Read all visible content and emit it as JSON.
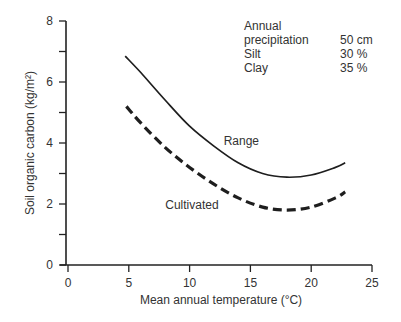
{
  "chart_data": {
    "type": "line",
    "title": "",
    "xlabel": "Mean annual temperature (°C)",
    "ylabel": "Soil organic carbon (kg/m²)",
    "xlim": [
      0,
      25
    ],
    "ylim": [
      0,
      8
    ],
    "x_ticks": [
      0,
      5,
      10,
      15,
      20,
      25
    ],
    "x_tick_labels": [
      "0",
      "5",
      "10",
      "15",
      "20",
      "25"
    ],
    "y_ticks_major": [
      0,
      2,
      4,
      6,
      8
    ],
    "y_tick_labels": [
      "0",
      "2",
      "4",
      "6",
      "8"
    ],
    "y_ticks_minor": [
      1,
      3,
      5,
      7
    ],
    "grid": false,
    "series": [
      {
        "name": "Range",
        "style": "solid",
        "x": [
          4.7,
          6,
          8,
          10,
          12,
          14,
          16,
          18,
          20,
          22,
          22.8
        ],
        "values": [
          6.85,
          6.3,
          5.4,
          4.55,
          3.9,
          3.35,
          3.0,
          2.88,
          2.95,
          3.2,
          3.35
        ]
      },
      {
        "name": "Cultivated",
        "style": "dashed",
        "x": [
          4.8,
          6,
          8,
          10,
          12,
          14,
          16,
          18,
          20,
          22,
          22.8
        ],
        "values": [
          5.2,
          4.65,
          3.85,
          3.2,
          2.65,
          2.2,
          1.9,
          1.8,
          1.9,
          2.2,
          2.4
        ]
      }
    ],
    "annotations": [
      {
        "text": "Range",
        "x": 12.8,
        "y": 3.95
      },
      {
        "text": "Cultivated",
        "x": 8.0,
        "y": 1.85
      }
    ],
    "legend": "none (curves labeled inline)"
  },
  "conditions": {
    "rows": [
      {
        "key": "Annual",
        "value": ""
      },
      {
        "key": "precipitation",
        "value": "50 cm"
      },
      {
        "key": "Silt",
        "value": "30 %"
      },
      {
        "key": "Clay",
        "value": "35 %"
      }
    ]
  }
}
